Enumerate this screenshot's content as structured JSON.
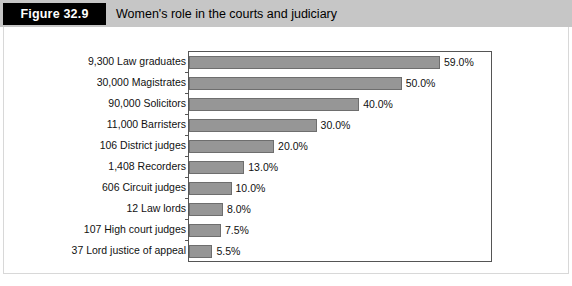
{
  "header": {
    "figure_number": "Figure 32.9",
    "title": "Women's role in the courts and judiciary",
    "band_color": "#c6c6c6",
    "number_box_color": "#000000"
  },
  "chart_data": {
    "type": "bar",
    "orientation": "horizontal",
    "title": "Women's role in the courts and judiciary",
    "xlabel": "",
    "ylabel": "",
    "xlim": [
      0,
      71
    ],
    "grid": false,
    "legend": null,
    "bar_color": "#969696",
    "bar_border_color": "#6e6e6e",
    "categories": [
      "9,300 Law graduates",
      "30,000 Magistrates",
      "90,000 Solicitors",
      "11,000 Barristers",
      "106 District judges",
      "1,408 Recorders",
      "606 Circuit judges",
      "12 Law lords",
      "107 High court judges",
      "37 Lord justice of appeal"
    ],
    "values": [
      59.0,
      50.0,
      40.0,
      30.0,
      20.0,
      13.0,
      10.0,
      8.0,
      7.5,
      5.5
    ],
    "value_labels": [
      "59.0%",
      "50.0%",
      "40.0%",
      "30.0%",
      "20.0%",
      "13.0%",
      "10.0%",
      "8.0%",
      "7.5%",
      "5.5%"
    ]
  }
}
